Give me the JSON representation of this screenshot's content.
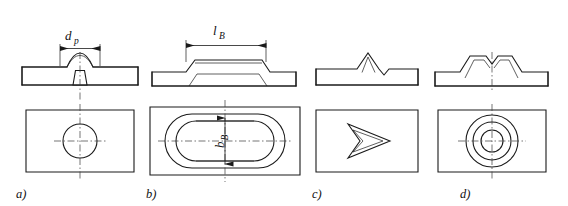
{
  "figure": {
    "background_color": "#ffffff",
    "line_color": "#1a1a1a",
    "hatch_color": "#2b2b2b",
    "centerline_color": "#3a3a3a"
  },
  "panels": [
    {
      "id": "a",
      "caption": "a)",
      "section_type": "round dome projection with conical cavity",
      "plan_type": "single circle with crosshair centerlines",
      "dimension": {
        "present": true,
        "symbol": "d",
        "subscript": "p",
        "full": "dp",
        "orientation": "horizontal",
        "location": "above section view"
      },
      "plan_circles": 1
    },
    {
      "id": "b",
      "caption": "b)",
      "section_type": "elongated trapezoidal raised boss",
      "plan_type": "two concentric stadium (oblong) outlines",
      "dimension": {
        "present": true,
        "symbol": "l",
        "subscript": "B",
        "full": "lB",
        "orientation": "horizontal",
        "location": "above section view"
      },
      "dimension_plan": {
        "present": true,
        "symbol": "b",
        "subscript": "B",
        "full": "bB",
        "orientation": "vertical",
        "location": "inside oblong plan view"
      },
      "plan_outlines": 2
    },
    {
      "id": "c",
      "caption": "c)",
      "section_type": "sharp triangular peak with adjacent notch",
      "plan_type": "double chevron / arrowhead pointing right",
      "dimension": {
        "present": false
      },
      "plan_outlines": 2
    },
    {
      "id": "d",
      "caption": "d)",
      "section_type": "annular ring boss with central depression",
      "plan_type": "three concentric circles with crosshair centerlines",
      "dimension": {
        "present": false
      },
      "plan_circles": 3
    }
  ],
  "captions": {
    "a": "a)",
    "b": "b)",
    "c": "c)",
    "d": "d)"
  },
  "labels": {
    "dp_base": "d",
    "dp_sub": "p",
    "lb_base": "l",
    "lb_sub": "B",
    "bb_base": "b",
    "bb_sub": "B"
  }
}
